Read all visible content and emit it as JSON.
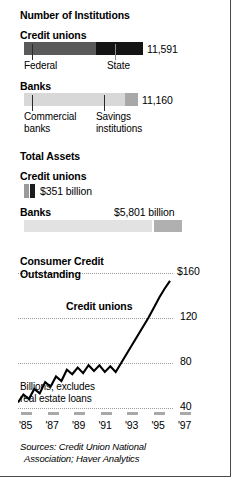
{
  "sections": {
    "institutions": {
      "title": "Number of Institutions",
      "credit_unions": {
        "label": "Credit unions",
        "total": "11,591",
        "segments": [
          {
            "name": "Federal",
            "label": "Federal",
            "value": 6981,
            "color": "#5a5a5a"
          },
          {
            "name": "State",
            "label": "State",
            "value": 4610,
            "color": "#141414"
          }
        ]
      },
      "banks": {
        "label": "Banks",
        "total": "11,160",
        "segments": [
          {
            "name": "Commercial banks",
            "label": "Commercial\nbanks",
            "value": 9143,
            "color": "#d8d8d8"
          },
          {
            "name": "Savings institutions",
            "label": "Savings\ninstitutions",
            "value": 2017,
            "color": "#a8a8a8"
          }
        ]
      }
    },
    "assets": {
      "title": "Total Assets",
      "credit_unions": {
        "label": "Credit unions",
        "value_text": "$351 billion",
        "value": 351,
        "segments": [
          {
            "name": "Federal",
            "value": 180,
            "color": "#9a9a9a"
          },
          {
            "name": "State",
            "value": 171,
            "color": "#1c1c1c"
          }
        ]
      },
      "banks": {
        "label": "Banks",
        "value_text": "$5,801 billion",
        "value": 5801,
        "segments": [
          {
            "name": "Commercial banks",
            "value": 4775,
            "color": "#e2e2e2"
          },
          {
            "name": "Savings institutions",
            "value": 1026,
            "color": "#b0b0b0"
          }
        ]
      }
    }
  },
  "chart_data": {
    "type": "line",
    "title": "Consumer Credit\nOutstanding",
    "title_line1": "Consumer Credit",
    "title_line2": "Outstanding",
    "series_label": "Credit unions",
    "note_line1": "Billions; excludes",
    "note_line2": "real estate loans",
    "ylabel": "",
    "xlabel": "",
    "ylim": [
      30,
      168
    ],
    "yticks": [
      "$160",
      "120",
      "80",
      "40"
    ],
    "ytick_values": [
      160,
      120,
      80,
      40
    ],
    "grid": true,
    "legend_position": "inline",
    "xticks": [
      "'85",
      "'87",
      "'89",
      "'91",
      "'93",
      "'95",
      "'97"
    ],
    "xtick_values": [
      1985,
      1987,
      1989,
      1991,
      1993,
      1995,
      1997
    ],
    "x": [
      1984.0,
      1984.5,
      1985.0,
      1985.5,
      1986.0,
      1986.5,
      1987.0,
      1987.5,
      1988.0,
      1988.5,
      1989.0,
      1989.5,
      1990.0,
      1990.5,
      1991.0,
      1991.5,
      1992.0,
      1992.5,
      1993.0,
      1993.5,
      1994.0,
      1994.5,
      1995.0,
      1995.5,
      1996.0,
      1996.5,
      1997.0,
      1997.5,
      1998.0
    ],
    "values": [
      45,
      52,
      48,
      57,
      53,
      63,
      59,
      68,
      64,
      74,
      70,
      76,
      71,
      78,
      73,
      78,
      72,
      77,
      72,
      80,
      88,
      96,
      104,
      112,
      120,
      129,
      138,
      146,
      153
    ],
    "series": [
      {
        "name": "Credit unions",
        "values": [
          45,
          52,
          48,
          57,
          53,
          63,
          59,
          68,
          64,
          74,
          70,
          76,
          71,
          78,
          73,
          78,
          72,
          77,
          72,
          80,
          88,
          96,
          104,
          112,
          120,
          129,
          138,
          146,
          153
        ]
      }
    ]
  },
  "sources": {
    "line1": "Sources: Credit Union National",
    "line2": "Association; Haver Analytics"
  }
}
